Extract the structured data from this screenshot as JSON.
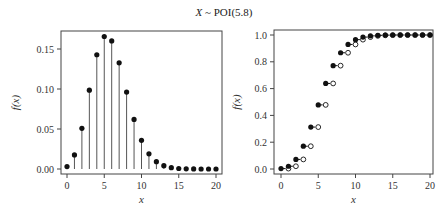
{
  "figure": {
    "title_var": "X",
    "title_rest": " ~ POI(5.8)"
  },
  "chart_data": [
    {
      "type": "scatter",
      "subtype": "stem",
      "title": "X ~ POI(5.8)",
      "xlabel": "x",
      "ylabel": "f(x)",
      "x": [
        0,
        1,
        2,
        3,
        4,
        5,
        6,
        7,
        8,
        9,
        10,
        11,
        12,
        13,
        14,
        15,
        16,
        17,
        18,
        19,
        20
      ],
      "values": [
        0.003,
        0.0176,
        0.0509,
        0.0985,
        0.1428,
        0.1656,
        0.1601,
        0.1327,
        0.0962,
        0.062,
        0.0359,
        0.019,
        0.0092,
        0.0041,
        0.0017,
        0.0006,
        0.0002,
        0.0001,
        0.0,
        0.0,
        0.0
      ],
      "xlim": [
        0,
        20
      ],
      "ylim": [
        0,
        0.17
      ],
      "xticks": [
        0,
        5,
        10,
        15,
        20
      ],
      "xtick_labels": [
        "0",
        "5",
        "10",
        "15",
        "20"
      ],
      "yticks": [
        0.0,
        0.05,
        0.1,
        0.15
      ],
      "ytick_labels": [
        "0.00",
        "0.05",
        "0.10",
        "0.15"
      ],
      "grid": false,
      "legend": null
    },
    {
      "type": "scatter",
      "subtype": "step-cdf",
      "title": "X ~ POI(5.8)",
      "xlabel": "x",
      "ylabel": "f(x)",
      "x": [
        0,
        1,
        2,
        3,
        4,
        5,
        6,
        7,
        8,
        9,
        10,
        11,
        12,
        13,
        14,
        15,
        16,
        17,
        18,
        19,
        20
      ],
      "values": [
        0.003,
        0.0206,
        0.0715,
        0.17,
        0.3128,
        0.4784,
        0.6385,
        0.7712,
        0.8674,
        0.9294,
        0.9653,
        0.9843,
        0.9935,
        0.9976,
        0.9993,
        0.9999,
        1.0,
        1.0,
        1.0,
        1.0,
        1.0
      ],
      "xlim": [
        0,
        20
      ],
      "ylim": [
        0,
        1.0
      ],
      "xticks": [
        0,
        5,
        10,
        15,
        20
      ],
      "xtick_labels": [
        "0",
        "5",
        "10",
        "15",
        "20"
      ],
      "yticks": [
        0.0,
        0.2,
        0.4,
        0.6,
        0.8,
        1.0
      ],
      "ytick_labels": [
        "0.0",
        "0.2",
        "0.4",
        "0.6",
        "0.8",
        "1.0"
      ],
      "grid": false,
      "legend": null
    }
  ],
  "layout": {
    "panels": [
      {
        "frame": [
          61,
          31,
          222,
          174
        ],
        "x0px": 67,
        "x20px": 216,
        "y0px": 169,
        "ytop_val": 0.15,
        "ytop_px": 49
      },
      {
        "frame": [
          274,
          30,
          433,
          174
        ],
        "x0px": 281,
        "x20px": 430,
        "y0px": 169,
        "ytop_val": 1.0,
        "ytop_px": 35
      }
    ],
    "colors": {
      "point": "#111111",
      "stem": "#555555",
      "frame": "#444444",
      "text": "#333333"
    }
  }
}
